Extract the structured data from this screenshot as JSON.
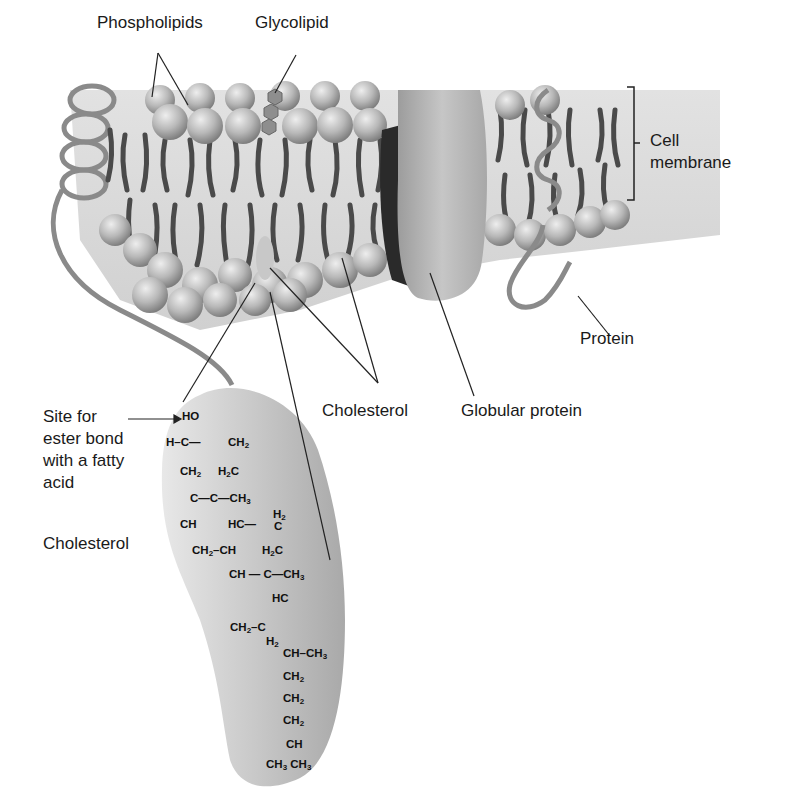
{
  "figure": {
    "labels": {
      "phospholipids": "Phospholipids",
      "glycolipid": "Glycolipid",
      "cell_membrane_line1": "Cell",
      "cell_membrane_line2": "membrane",
      "protein": "Protein",
      "cholesterol_membrane": "Cholesterol",
      "globular_protein": "Globular protein",
      "site_line1": "Site for",
      "site_line2": "ester bond",
      "site_line3": "with a fatty",
      "site_line4": "acid",
      "cholesterol_structure": "Cholesterol"
    },
    "structure": {
      "ho": "HO",
      "h_c": "H–C—",
      "ch2_a": "CH2",
      "ch2_b": "CH2",
      "h2c_a": "H2C",
      "c_c_ch3": "C—C—CH3",
      "ch": "CH",
      "hc_a": "HC—",
      "h2_a": "H2",
      "c_a": "C",
      "ch2_ch": "CH2–CH",
      "h2c_b": "H2C",
      "ch_c_ch3": "CH — C—CH3",
      "hc_b": "HC",
      "ch2_c": "CH2–C",
      "h2_b": "H2",
      "ch_ch3": "CH–CH3",
      "chain_1": "CH2",
      "chain_2": "CH2",
      "chain_3": "CH2",
      "chain_ch": "CH",
      "terminal": "CH3 CH3"
    },
    "colors": {
      "background": "#ffffff",
      "head": "#b5b5b5",
      "tail": "#4a4a4a",
      "protein": "#b0b0b0",
      "cholesterol_blob": "#c4c4c4",
      "leader": "#222222"
    }
  }
}
